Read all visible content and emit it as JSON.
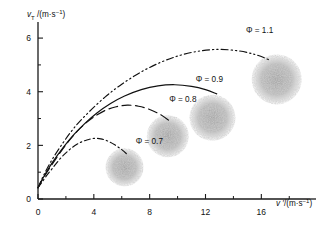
{
  "chart_data": {
    "type": "line",
    "title": "",
    "xlabel": "v ′/(m·s⁻¹)",
    "ylabel": "v_T /(m·s⁻¹)",
    "xlim": [
      0,
      19.2
    ],
    "ylim": [
      0,
      6.6
    ],
    "grid": false,
    "legend_position": "inline-annotations",
    "xticks": [
      0,
      4,
      8,
      12,
      16
    ],
    "xticklabels": [
      "0",
      "4",
      "8",
      "12",
      "16"
    ],
    "xminorticks": [
      2,
      6,
      10,
      14,
      18
    ],
    "yticks": [
      0,
      2,
      4,
      6
    ],
    "yticklabels": [
      "0",
      "2",
      "4",
      "6"
    ],
    "yminorticks": [
      1,
      3,
      5
    ],
    "series": [
      {
        "name": "Φ = 0.7",
        "label": "Φ = 0.7",
        "linestyle": "dash-dot",
        "label_x": 7.0,
        "label_y": 2.05,
        "blob": {
          "x": 6.2,
          "y": 1.18,
          "r": 19
        },
        "points": [
          [
            0.0,
            0.42
          ],
          [
            0.25,
            0.6
          ],
          [
            0.6,
            0.86
          ],
          [
            1.0,
            1.12
          ],
          [
            1.5,
            1.45
          ],
          [
            2.0,
            1.72
          ],
          [
            2.5,
            1.94
          ],
          [
            3.0,
            2.1
          ],
          [
            3.5,
            2.2
          ],
          [
            4.0,
            2.26
          ],
          [
            4.5,
            2.24
          ],
          [
            5.0,
            2.16
          ],
          [
            5.5,
            2.02
          ],
          [
            6.0,
            1.84
          ],
          [
            6.4,
            1.66
          ]
        ]
      },
      {
        "name": "Φ = 0.8",
        "label": "Φ = 0.8",
        "linestyle": "long-dash",
        "label_x": 9.4,
        "label_y": 3.62,
        "blob": {
          "x": 9.3,
          "y": 2.34,
          "r": 21
        },
        "points": [
          [
            0.0,
            0.42
          ],
          [
            0.4,
            0.8
          ],
          [
            1.0,
            1.28
          ],
          [
            1.6,
            1.74
          ],
          [
            2.2,
            2.16
          ],
          [
            2.8,
            2.52
          ],
          [
            3.4,
            2.82
          ],
          [
            4.0,
            3.06
          ],
          [
            4.8,
            3.3
          ],
          [
            5.6,
            3.44
          ],
          [
            6.4,
            3.5
          ],
          [
            7.2,
            3.46
          ],
          [
            8.0,
            3.34
          ],
          [
            8.8,
            3.14
          ],
          [
            9.4,
            2.92
          ]
        ]
      },
      {
        "name": "Φ = 0.9",
        "label": "Φ = 0.9",
        "linestyle": "solid",
        "label_x": 11.3,
        "label_y": 4.36,
        "blob": {
          "x": 12.5,
          "y": 3.03,
          "r": 23
        },
        "points": [
          [
            0.0,
            0.42
          ],
          [
            0.4,
            0.82
          ],
          [
            1.0,
            1.34
          ],
          [
            1.8,
            1.92
          ],
          [
            2.6,
            2.42
          ],
          [
            3.4,
            2.84
          ],
          [
            4.2,
            3.2
          ],
          [
            5.2,
            3.56
          ],
          [
            6.2,
            3.84
          ],
          [
            7.4,
            4.08
          ],
          [
            8.6,
            4.22
          ],
          [
            9.8,
            4.26
          ],
          [
            11.0,
            4.2
          ],
          [
            12.0,
            4.08
          ],
          [
            12.8,
            3.92
          ]
        ]
      },
      {
        "name": "Φ = 1.1",
        "label": "Φ = 1.1",
        "linestyle": "dash-dot-dot",
        "label_x": 14.9,
        "label_y": 6.18,
        "blob": {
          "x": 17.1,
          "y": 4.46,
          "r": 25
        },
        "points": [
          [
            0.0,
            0.42
          ],
          [
            0.4,
            0.88
          ],
          [
            1.0,
            1.46
          ],
          [
            1.8,
            2.1
          ],
          [
            2.6,
            2.66
          ],
          [
            3.6,
            3.22
          ],
          [
            4.8,
            3.8
          ],
          [
            6.0,
            4.28
          ],
          [
            7.4,
            4.74
          ],
          [
            8.8,
            5.1
          ],
          [
            10.2,
            5.36
          ],
          [
            11.6,
            5.52
          ],
          [
            13.0,
            5.58
          ],
          [
            14.4,
            5.52
          ],
          [
            15.6,
            5.38
          ],
          [
            16.6,
            5.18
          ]
        ]
      }
    ]
  },
  "axis": {
    "y_symbol": "v",
    "y_sub": "T",
    "y_rest": " /(m·s",
    "y_sup": "−1",
    "y_close": ")",
    "x_symbol": "v ′",
    "x_rest": "/(m·s",
    "x_sup": "−1",
    "x_close": ")"
  }
}
